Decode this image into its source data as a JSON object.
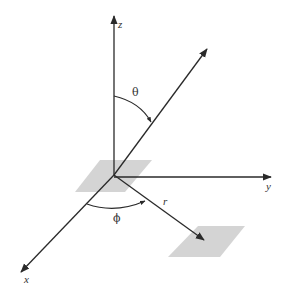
{
  "diagram": {
    "title": "",
    "type": "spherical-coordinates",
    "colors": {
      "line": "#2a2a2a",
      "patch": "#d4d4d4",
      "text": "#333333"
    },
    "axes": {
      "z": {
        "label": "z"
      },
      "y": {
        "label": "y"
      },
      "x": {
        "label": "x"
      }
    },
    "angles": {
      "theta": {
        "label": "θ"
      },
      "phi": {
        "label": "ϕ"
      }
    },
    "vectors": {
      "r": {
        "label": "r"
      }
    },
    "patches": [
      {
        "name": "origin-patch"
      },
      {
        "name": "projection-patch"
      }
    ]
  }
}
